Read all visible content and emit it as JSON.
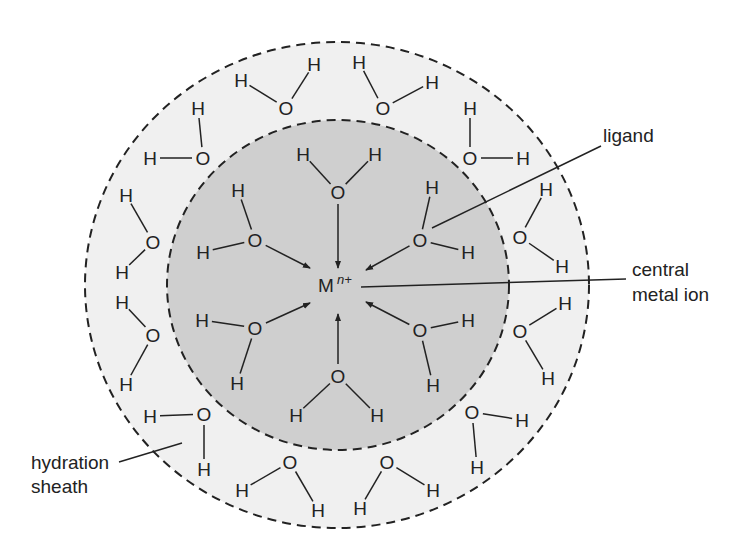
{
  "diagram": {
    "colors": {
      "background": "#ffffff",
      "outer_sheath_fill": "#f0f0f0",
      "inner_sphere_fill": "#cfcfcf",
      "stroke": "#222222"
    },
    "outer_sheath": {
      "cx": 337,
      "cy": 285,
      "rx": 252,
      "ry": 243
    },
    "inner_sphere": {
      "cx": 338,
      "cy": 285,
      "rx": 171,
      "ry": 165
    },
    "central_ion": {
      "symbol": "M",
      "charge": "n+",
      "x": 316,
      "y": 292
    },
    "labels": {
      "ligand": "ligand",
      "central_metal_ion_line1": "central",
      "central_metal_ion_line2": "metal ion",
      "hydration_sheath_line1": "hydration",
      "hydration_sheath_line2": "sheath"
    },
    "atom_symbols": {
      "oxygen": "O",
      "hydrogen": "H"
    },
    "inner_ligands": [
      {
        "O": [
          338,
          192
        ],
        "H1": [
          303,
          154
        ],
        "H2": [
          375,
          154
        ],
        "arrow_to": [
          338,
          268
        ]
      },
      {
        "O": [
          255,
          240
        ],
        "H1": [
          238,
          190
        ],
        "H2": [
          203,
          252
        ],
        "arrow_to": [
          310,
          268
        ]
      },
      {
        "O": [
          420,
          240
        ],
        "H1": [
          432,
          187
        ],
        "H2": [
          468,
          252
        ],
        "arrow_to": [
          366,
          270
        ]
      },
      {
        "O": [
          255,
          328
        ],
        "H1": [
          202,
          320
        ],
        "H2": [
          237,
          383
        ],
        "arrow_to": [
          310,
          303
        ]
      },
      {
        "O": [
          420,
          330
        ],
        "H1": [
          468,
          320
        ],
        "H2": [
          433,
          385
        ],
        "arrow_to": [
          366,
          302
        ]
      },
      {
        "O": [
          338,
          376
        ],
        "H1": [
          296,
          415
        ],
        "H2": [
          377,
          415
        ],
        "arrow_to": [
          338,
          314
        ]
      }
    ],
    "sheath_waters": [
      {
        "O": [
          286,
          108
        ],
        "H1": [
          241,
          80
        ],
        "H2": [
          314,
          64
        ]
      },
      {
        "O": [
          383,
          108
        ],
        "H1": [
          359,
          62
        ],
        "H2": [
          432,
          82
        ]
      },
      {
        "O": [
          203,
          158
        ],
        "H1": [
          198,
          108
        ],
        "H2": [
          150,
          158
        ]
      },
      {
        "O": [
          470,
          158
        ],
        "H1": [
          470,
          108
        ],
        "H2": [
          523,
          158
        ]
      },
      {
        "O": [
          153,
          242
        ],
        "H1": [
          126,
          195
        ],
        "H2": [
          122,
          272
        ]
      },
      {
        "O": [
          520,
          237
        ],
        "H1": [
          546,
          189
        ],
        "H2": [
          562,
          266
        ]
      },
      {
        "O": [
          153,
          335
        ],
        "H1": [
          122,
          302
        ],
        "H2": [
          126,
          384
        ]
      },
      {
        "O": [
          520,
          331
        ],
        "H1": [
          565,
          303
        ],
        "H2": [
          548,
          378
        ]
      },
      {
        "O": [
          204,
          414
        ],
        "H1": [
          150,
          416
        ],
        "H2": [
          204,
          469
        ]
      },
      {
        "O": [
          472,
          412
        ],
        "H1": [
          522,
          420
        ],
        "H2": [
          477,
          467
        ]
      },
      {
        "O": [
          290,
          462
        ],
        "H1": [
          242,
          490
        ],
        "H2": [
          318,
          510
        ]
      },
      {
        "O": [
          387,
          462
        ],
        "H1": [
          360,
          508
        ],
        "H2": [
          433,
          490
        ]
      }
    ]
  }
}
